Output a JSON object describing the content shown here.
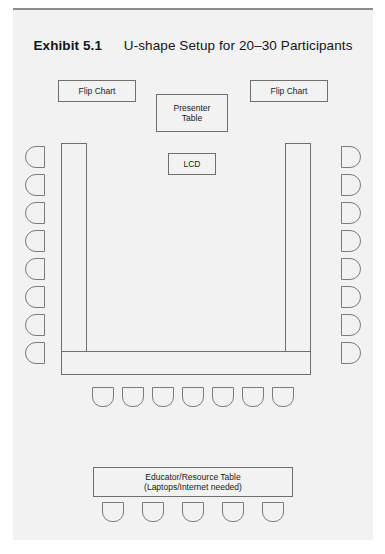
{
  "exhibit": {
    "label": "Exhibit 5.1",
    "title": "U-shape Setup for 20–30 Participants"
  },
  "equipment": {
    "flip_chart_left": "Flip Chart",
    "flip_chart_right": "Flip Chart",
    "presenter_table_line1": "Presenter",
    "presenter_table_line2": "Table",
    "lcd": "LCD"
  },
  "educator_table": {
    "line1": "Educator/Resource Table",
    "line2": "(Laptops/Internet needed)"
  },
  "seating": {
    "left_chair_count": 8,
    "right_chair_count": 8,
    "bottom_chair_count": 7,
    "educator_chair_count": 5,
    "total_chairs": 28
  },
  "colors": {
    "panel_background": "#f2f2f2",
    "page_background": "#ffffff",
    "line": "#6f6f6f",
    "chair_line": "#7b7b7b",
    "text": "#1a1a1a",
    "rule": "#8d8d8d"
  }
}
